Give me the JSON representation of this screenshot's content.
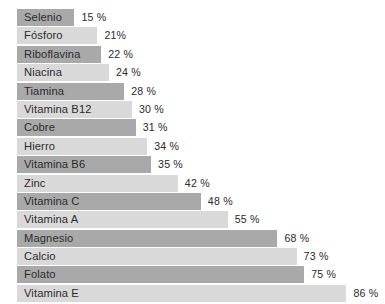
{
  "chart_data": {
    "type": "bar",
    "orientation": "horizontal",
    "title": "",
    "subtitle": "",
    "xlabel": "",
    "ylabel": "",
    "xlim": [
      0,
      100
    ],
    "grid": false,
    "legend": null,
    "value_suffix": "%",
    "categories": [
      "Selenio",
      "Fósforo",
      "Riboflavina",
      "Niacina",
      "Tiamina",
      "Vitamina B12",
      "Cobre",
      "Hierro",
      "Vitamina B6",
      "Zinc",
      "Vitamina C",
      "Vitamina A",
      "Magnesio",
      "Calcio",
      "Folato",
      "Vitamina  E"
    ],
    "values": [
      15,
      21,
      22,
      24,
      28,
      30,
      31,
      34,
      35,
      42,
      48,
      55,
      68,
      73,
      75,
      86
    ],
    "labels": [
      "15 %",
      "21%",
      "22 %",
      "24 %",
      "28 %",
      "30 %",
      "31 %",
      "34 %",
      "35 %",
      "42 %",
      "48 %",
      "55 %",
      "68 %",
      "73 %",
      "75 %",
      "86 %"
    ],
    "bar_colors": [
      "#a9a9a9",
      "#d9d9d9",
      "#a9a9a9",
      "#d9d9d9",
      "#a9a9a9",
      "#d9d9d9",
      "#a9a9a9",
      "#d9d9d9",
      "#a9a9a9",
      "#d9d9d9",
      "#a9a9a9",
      "#d9d9d9",
      "#a9a9a9",
      "#d9d9d9",
      "#a9a9a9",
      "#d9d9d9"
    ],
    "colors": {
      "background": "#ffffff",
      "bar_dark": "#a9a9a9",
      "bar_light": "#d9d9d9",
      "text": "#2b2b2b"
    },
    "geometry": {
      "bar_origin_x": 17,
      "px_per_unit": 3.83,
      "value_gap_px": 7
    }
  }
}
